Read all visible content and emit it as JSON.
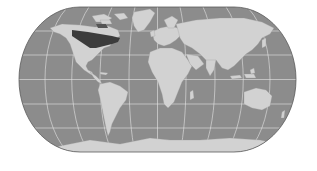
{
  "map": {
    "projection": "eckert-iv-world",
    "colors": {
      "background": "#ffffff",
      "ocean": "#8c8c8c",
      "land": "#d2d2d2",
      "highlight": "#3c3c3c",
      "grid": "#e6e6e6",
      "outline": "#5a5a5a"
    },
    "graticule": {
      "parallels_deg": [
        -60,
        -30,
        0,
        30,
        60
      ],
      "meridians_step_deg": 30
    },
    "highlighted_region": "northern-north-america-boreal"
  }
}
